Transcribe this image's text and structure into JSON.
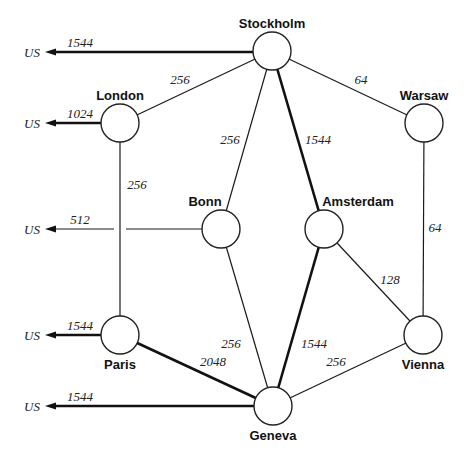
{
  "diagram": {
    "type": "network-topology",
    "nodes": [
      {
        "id": "stockholm",
        "label": "Stockholm",
        "x": 272,
        "y": 51,
        "r": 19,
        "label_x": 272,
        "label_y": 28,
        "anchor": "middle"
      },
      {
        "id": "london",
        "label": "London",
        "x": 120,
        "y": 123,
        "r": 19,
        "label_x": 120,
        "label_y": 100,
        "anchor": "middle"
      },
      {
        "id": "warsaw",
        "label": "Warsaw",
        "x": 424,
        "y": 123,
        "r": 19,
        "label_x": 424,
        "label_y": 100,
        "anchor": "middle"
      },
      {
        "id": "bonn",
        "label": "Bonn",
        "x": 221,
        "y": 229,
        "r": 19,
        "label_x": 205,
        "label_y": 206,
        "anchor": "middle"
      },
      {
        "id": "amsterdam",
        "label": "Amsterdam",
        "x": 324,
        "y": 229,
        "r": 19,
        "label_x": 358,
        "label_y": 206,
        "anchor": "middle"
      },
      {
        "id": "paris",
        "label": "Paris",
        "x": 120,
        "y": 335,
        "r": 19,
        "label_x": 120,
        "label_y": 369,
        "anchor": "middle"
      },
      {
        "id": "vienna",
        "label": "Vienna",
        "x": 423,
        "y": 335,
        "r": 19,
        "label_x": 423,
        "label_y": 369,
        "anchor": "middle"
      },
      {
        "id": "geneva",
        "label": "Geneva",
        "x": 273,
        "y": 406,
        "r": 19,
        "label_x": 273,
        "label_y": 440,
        "anchor": "middle"
      }
    ],
    "edges": [
      {
        "from": "stockholm",
        "to": "london",
        "label": "256",
        "thick": false,
        "label_x": 180,
        "label_y": 84
      },
      {
        "from": "stockholm",
        "to": "warsaw",
        "label": "64",
        "thick": false,
        "label_x": 361,
        "label_y": 84
      },
      {
        "from": "stockholm",
        "to": "bonn",
        "label": "256",
        "thick": false,
        "label_x": 230,
        "label_y": 144
      },
      {
        "from": "stockholm",
        "to": "amsterdam",
        "label": "1544",
        "thick": true,
        "label_x": 318,
        "label_y": 144
      },
      {
        "from": "london",
        "to": "paris",
        "label": "256",
        "thick": false,
        "label_x": 137,
        "label_y": 189
      },
      {
        "from": "warsaw",
        "to": "vienna",
        "label": "64",
        "thick": false,
        "label_x": 435,
        "label_y": 232
      },
      {
        "from": "bonn",
        "to": "geneva",
        "label": "256",
        "thick": false,
        "label_x": 231,
        "label_y": 348
      },
      {
        "from": "amsterdam",
        "to": "geneva",
        "label": "1544",
        "thick": true,
        "label_x": 314,
        "label_y": 348
      },
      {
        "from": "amsterdam",
        "to": "vienna",
        "label": "128",
        "thick": false,
        "label_x": 390,
        "label_y": 284
      },
      {
        "from": "paris",
        "to": "geneva",
        "label": "2048",
        "thick": true,
        "label_x": 213,
        "label_y": 366
      },
      {
        "from": "vienna",
        "to": "geneva",
        "label": "256",
        "thick": false,
        "label_x": 336,
        "label_y": 366
      }
    ],
    "us_links": [
      {
        "from": "stockholm",
        "label": "US",
        "bandwidth": "1544",
        "thick": true,
        "y": 52,
        "end_x": 253
      },
      {
        "from": "london",
        "label": "US",
        "bandwidth": "1024",
        "thick": true,
        "y": 123,
        "end_x": 101
      },
      {
        "from": "bonn",
        "label": "US",
        "bandwidth": "512",
        "thick": false,
        "y": 229,
        "end_x": 202,
        "gap_at_x": 120
      },
      {
        "from": "paris",
        "label": "US",
        "bandwidth": "1544",
        "thick": true,
        "y": 335,
        "end_x": 101
      },
      {
        "from": "geneva",
        "label": "US",
        "bandwidth": "1544",
        "thick": true,
        "y": 406,
        "end_x": 254
      }
    ],
    "us_label_x": 24,
    "arrow_tip_x": 45,
    "bandwidth_label_x": 80
  }
}
